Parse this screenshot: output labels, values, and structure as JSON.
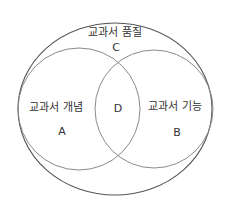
{
  "diagram": {
    "type": "venn",
    "outer": {
      "label": "교과서 품질",
      "region": "C"
    },
    "left": {
      "label": "교과서 개념",
      "region": "A"
    },
    "right": {
      "label": "교과서 기능",
      "region": "B"
    },
    "intersection": {
      "region": "D"
    },
    "colors": {
      "stroke": "#7a7a7a",
      "outer_stroke": "#555555",
      "text": "#333333",
      "background": "#ffffff"
    }
  }
}
